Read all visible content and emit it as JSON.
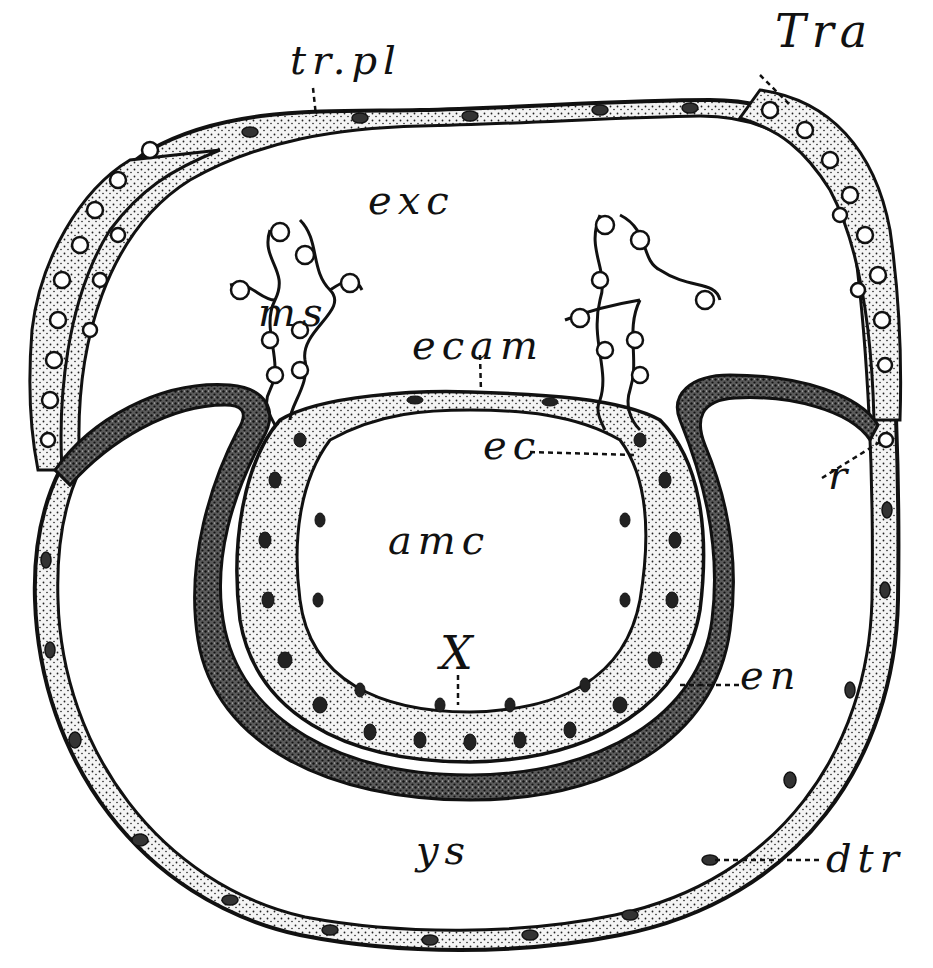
{
  "figure": {
    "type": "histological section diagram",
    "colors": {
      "ink": "#111111",
      "stipple_fill": "#e9e9e9",
      "dark_layer_fill": "#3a3a3a",
      "background": "#ffffff"
    },
    "labels": [
      {
        "id": "trpl",
        "text": "tr.pl",
        "x": 290,
        "y": 40
      },
      {
        "id": "tra",
        "text": "Tra",
        "x": 775,
        "y": 8
      },
      {
        "id": "exc",
        "text": "exc",
        "x": 368,
        "y": 180
      },
      {
        "id": "ms",
        "text": "ms",
        "x": 258,
        "y": 292
      },
      {
        "id": "ecam",
        "text": "ecam",
        "x": 412,
        "y": 325
      },
      {
        "id": "ec",
        "text": "ec",
        "x": 483,
        "y": 425
      },
      {
        "id": "amc",
        "text": "amc",
        "x": 388,
        "y": 520
      },
      {
        "id": "x",
        "text": "X",
        "x": 440,
        "y": 630
      },
      {
        "id": "r",
        "text": "r",
        "x": 828,
        "y": 455
      },
      {
        "id": "en",
        "text": "en",
        "x": 740,
        "y": 655
      },
      {
        "id": "ys",
        "text": "ys",
        "x": 416,
        "y": 830
      },
      {
        "id": "dtr",
        "text": "dtr",
        "x": 826,
        "y": 838
      }
    ],
    "structures": [
      "trophoblast-plate",
      "trophoblast-thickening",
      "exocoelom",
      "mesoderm-strands",
      "ectodermal-amnion",
      "embryonic-ectoderm",
      "amniotic-cavity",
      "endoderm",
      "yolk-sac",
      "distal-trophoblast"
    ]
  }
}
